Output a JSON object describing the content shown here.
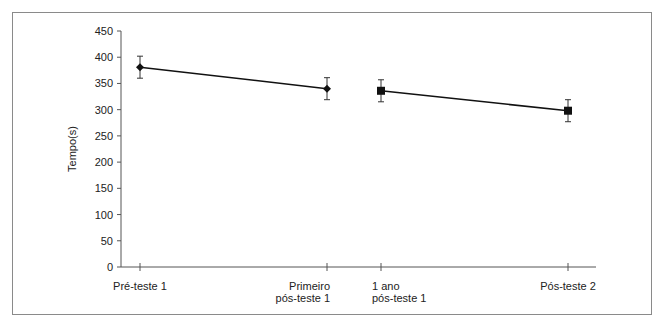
{
  "chart_data": {
    "type": "line",
    "title": "",
    "xlabel": "",
    "ylabel": "Tempo(s)",
    "ylim": [
      0,
      450
    ],
    "yticks": [
      0,
      50,
      100,
      150,
      200,
      250,
      300,
      350,
      400,
      450
    ],
    "grid": false,
    "legend": null,
    "categories": [
      "Pré-teste 1",
      "Primeiro pós-teste 1",
      "1 ano pós-teste 1",
      "Pós-teste 2"
    ],
    "category_lines": [
      [
        "Pré-teste 1"
      ],
      [
        "Primeiro",
        "pós-teste 1"
      ],
      [
        "1 ano",
        "pós-teste 1"
      ],
      [
        "Pós-teste 2"
      ]
    ],
    "series": [
      {
        "name": "Segment 1",
        "marker": "diamond",
        "points": [
          {
            "x": "Pré-teste 1",
            "y": 381,
            "err": 21
          },
          {
            "x": "Primeiro pós-teste 1",
            "y": 340,
            "err": 21
          }
        ]
      },
      {
        "name": "Segment 2",
        "marker": "square",
        "points": [
          {
            "x": "1 ano pós-teste 1",
            "y": 336,
            "err": 21
          },
          {
            "x": "Pós-teste 2",
            "y": 298,
            "err": 21
          }
        ]
      }
    ],
    "colors": {
      "line": "#111111",
      "axis": "#555555",
      "frame": "#8a8a8a"
    }
  }
}
